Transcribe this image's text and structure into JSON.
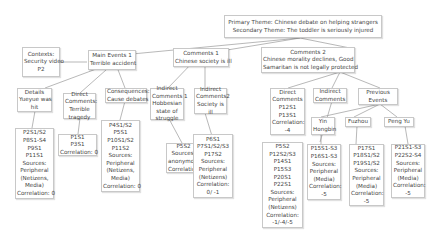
{
  "root": {
    "lines": [
      "Primary Theme: Chinese debate on helping strangers",
      "Secondary Theme: The toddler is seriously injured"
    ]
  },
  "context": {
    "lines": [
      "Contexts:",
      "Security video",
      "P2"
    ]
  },
  "main_events": {
    "lines": [
      "Main Events 1",
      "Terrible accident"
    ],
    "children": {
      "details": {
        "lines": [
          "Details",
          "Yueyue was",
          "hit"
        ]
      },
      "details_leaf": {
        "lines": [
          "P2S1/S2",
          "P8S1-S4",
          "P9S1",
          "P11S1",
          "Sources:",
          "Peripheral",
          "(Netizens,",
          "Media)",
          "Correlation: 0"
        ]
      },
      "direct": {
        "lines": [
          "Direct",
          "Comments:",
          "Terrible",
          "tragedy"
        ]
      },
      "direct_leaf": {
        "lines": [
          "P1S1",
          "P3S1",
          "Correlation: 0"
        ]
      },
      "consequences": {
        "lines": [
          "Consequences:",
          "Cause debates"
        ]
      },
      "consequences_leaf": {
        "lines": [
          "P4S1/S2",
          "P5S1",
          "P10S1/S2",
          "P11S2",
          "Sources:",
          "Peripheral",
          "(Netizens,",
          "Media)",
          "Correlation: 0"
        ]
      }
    }
  },
  "comments1": {
    "lines": [
      "Comments 1",
      "Chinese society is ill"
    ],
    "children": {
      "indirect1": {
        "lines": [
          "Indirect",
          "Comments 1",
          "Hobbesian",
          "state of",
          "struggle"
        ]
      },
      "indirect1_leaf": {
        "lines": [
          "P5S2",
          "Sources:",
          "anonymous",
          "Correlation: 0"
        ]
      },
      "indirect2": {
        "lines": [
          "Indirect",
          "Comments2",
          "Society is",
          "ill"
        ]
      },
      "indirect2_leaf": {
        "lines": [
          "P6S1",
          "P7S1/S2/S3",
          "P17S2",
          "Sources:",
          "Peripheral",
          "(Netizens)",
          "Correlation:",
          "0/ -1"
        ]
      }
    }
  },
  "comments2": {
    "lines": [
      "Comments 2",
      "Chinese morality declines, Good",
      "Samaritan is not legally protected"
    ],
    "children": {
      "direct": {
        "lines": [
          "Direct",
          "Comments",
          "P12S1",
          "P13S1",
          "Correlation:",
          "-4"
        ]
      },
      "indirect": {
        "lines": [
          "Indirect",
          "Comments"
        ]
      },
      "indirect_leaf": {
        "lines": [
          "P5S2",
          "P12S2/S3",
          "P14S1",
          "P15S3",
          "P20S1",
          "P22S1",
          "Sources:",
          "Peripheral",
          "(Netizens)",
          "Correlation:",
          "-1/-4/-5"
        ]
      },
      "previous": {
        "lines": [
          "Previous",
          "Events"
        ]
      },
      "yin": {
        "lines": [
          "Yin",
          "Hongbin"
        ]
      },
      "yin_leaf": {
        "lines": [
          "P15S1-S3",
          "P16S1-S3",
          "Sources:",
          "Peripheral",
          "(Media)",
          "Correlation:",
          "-5"
        ]
      },
      "fuzhou": {
        "lines": [
          "Fuzhou"
        ]
      },
      "fuzhou_leaf": {
        "lines": [
          "P17S1",
          "P18S1/S2",
          "P19S1/S2",
          "Sources:",
          "Peripheral",
          "(Media)",
          "Correlation:",
          "-5"
        ]
      },
      "peng": {
        "lines": [
          "Peng Yu"
        ]
      },
      "peng_leaf": {
        "lines": [
          "P21S1-S3",
          "P22S2-S4",
          "Sources:",
          "Peripheral",
          "(Media)",
          "Correlation:",
          "-5"
        ]
      }
    }
  }
}
